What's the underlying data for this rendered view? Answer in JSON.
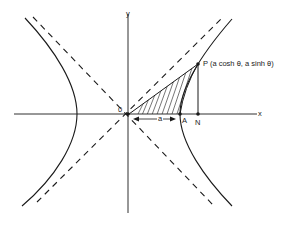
{
  "diagram": {
    "title": "",
    "type": "rectangular hyperbola with asymptotes and hyperbolic sector",
    "labels": {
      "x_axis": "x",
      "y_axis": "y",
      "origin": "0",
      "point_a": "A",
      "point_n": "N",
      "point_p": "P (a cosh θ, a sinh θ)",
      "distance_a": "a"
    },
    "elements": [
      {
        "name": "x-axis",
        "kind": "axis"
      },
      {
        "name": "y-axis",
        "kind": "axis"
      },
      {
        "name": "hyperbola-right-branch",
        "kind": "curve"
      },
      {
        "name": "hyperbola-left-branch",
        "kind": "curve"
      },
      {
        "name": "asymptote-positive",
        "kind": "dashed line"
      },
      {
        "name": "asymptote-negative",
        "kind": "dashed line"
      },
      {
        "name": "shaded-sector-OAP",
        "kind": "hatched region"
      },
      {
        "name": "segment-PN",
        "kind": "line"
      },
      {
        "name": "dimension-arrow-OA",
        "kind": "double arrow",
        "label": "a"
      }
    ],
    "colors": {
      "ink": "#1a1a1a",
      "background": "#ffffff"
    }
  }
}
